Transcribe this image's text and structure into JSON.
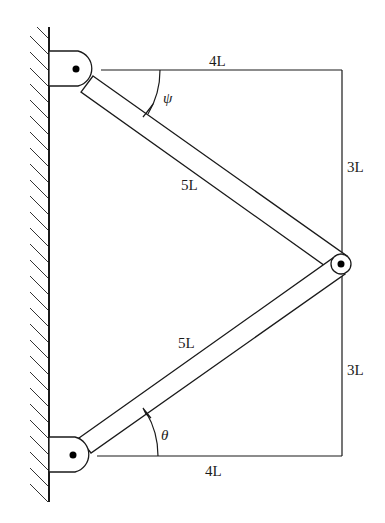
{
  "diagram": {
    "type": "two-link-truss",
    "labels": {
      "top_horizontal": "4L",
      "bottom_horizontal": "4L",
      "upper_vertical": "3L",
      "lower_vertical": "3L",
      "upper_link": "5L",
      "lower_link": "5L",
      "upper_angle": "ψ",
      "lower_angle": "θ"
    },
    "colors": {
      "line": "#1a1a1a",
      "background": "#ffffff"
    }
  }
}
